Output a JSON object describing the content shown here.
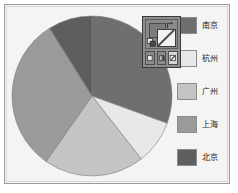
{
  "chart_data": {
    "type": "pie",
    "title": "",
    "categories": [
      "南京",
      "杭州",
      "广州",
      "上海",
      "北京"
    ],
    "values": [
      30.5,
      9.0,
      20.5,
      31.5,
      8.5
    ],
    "angles_deg": [
      110,
      32,
      73,
      113,
      32
    ],
    "colors": [
      "#6f6f6f",
      "#e8e8e8",
      "#c4c4c4",
      "#9a9a9a",
      "#5e5e5e"
    ],
    "start_angle_deg": -90,
    "direction": "clockwise",
    "legend_position": "right",
    "grid": false,
    "xlabel": "",
    "ylabel": ""
  },
  "legend": {
    "items": [
      {
        "label": "南京",
        "color": "#6f6f6f"
      },
      {
        "label": "杭州",
        "color": "#e8e8e8"
      },
      {
        "label": "广州",
        "color": "#c4c4c4"
      },
      {
        "label": "上海",
        "color": "#9a9a9a"
      },
      {
        "label": "北京",
        "color": "#5e5e5e"
      }
    ]
  },
  "palette_widget": {
    "fill_swatch": "none",
    "stroke_swatch": "#7c7c7c",
    "swap_icon": "swap-colors-icon",
    "default_icon": "default-colors-icon",
    "modes": [
      {
        "name": "flat-color-mode",
        "selected": false
      },
      {
        "name": "gradient-mode",
        "selected": false
      },
      {
        "name": "none-mode",
        "selected": true
      }
    ]
  },
  "canvas": {
    "background": "#f4f4f4",
    "border_color": "#9a9a9a"
  }
}
